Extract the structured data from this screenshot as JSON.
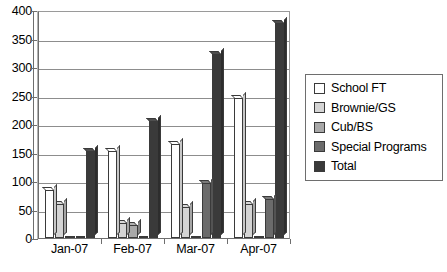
{
  "chart_data": {
    "type": "bar",
    "title": "",
    "subtitle": "",
    "xlabel": "",
    "ylabel": "",
    "categories": [
      "Jan-07",
      "Feb-07",
      "Mar-07",
      "Apr-07"
    ],
    "series": [
      {
        "name": "School FT",
        "color": "#ffffff",
        "values": [
          85,
          153,
          165,
          245
        ]
      },
      {
        "name": "Brownie/GS",
        "color": "#d4d4d4",
        "values": [
          60,
          27,
          55,
          60
        ]
      },
      {
        "name": "Cub/BS",
        "color": "#a8a8a8",
        "values": [
          0,
          22,
          0,
          0
        ]
      },
      {
        "name": "Special Programs",
        "color": "#6b6b6b",
        "values": [
          0,
          0,
          97,
          68
        ]
      },
      {
        "name": "Total",
        "color": "#3a3a3a",
        "values": [
          152,
          205,
          322,
          378
        ]
      }
    ],
    "ylim": [
      0,
      400
    ],
    "yticks": [
      0,
      50,
      100,
      150,
      200,
      250,
      300,
      350,
      400
    ],
    "ytick_labels": [
      "0",
      "50",
      "100",
      "150",
      "200",
      "250",
      "300",
      "350",
      "400"
    ],
    "grid": true,
    "grid_axis": "y",
    "legend_position": "right",
    "style": "3d-column",
    "plot_background": "#ffffff",
    "grid_color": "#8d8d8d",
    "axis_color": "#6e6e6e",
    "bar_outline_color": "#3a3a3a"
  },
  "legend": {
    "items": [
      {
        "label": "School FT",
        "swatch": "#ffffff"
      },
      {
        "label": "Brownie/GS",
        "swatch": "#d4d4d4"
      },
      {
        "label": "Cub/BS",
        "swatch": "#a8a8a8"
      },
      {
        "label": "Special Programs",
        "swatch": "#6b6b6b"
      },
      {
        "label": "Total",
        "swatch": "#3a3a3a"
      }
    ]
  }
}
